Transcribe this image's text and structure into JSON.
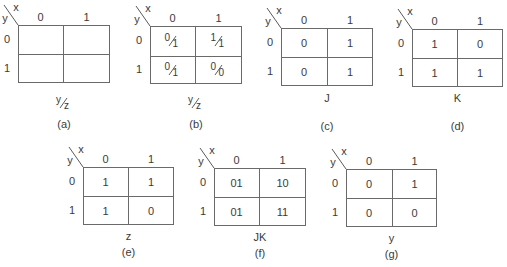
{
  "panels": [
    {
      "id": "a",
      "caption": "(a)",
      "row_var": "y",
      "col_var": "x",
      "col_headers": [
        "0",
        "1"
      ],
      "row_headers": [
        "0",
        "1"
      ],
      "cells": [
        [
          "",
          ""
        ],
        [
          "",
          ""
        ]
      ],
      "label": {
        "num": "y",
        "den": "z"
      }
    },
    {
      "id": "b",
      "caption": "(b)",
      "row_var": "y",
      "col_var": "x",
      "col_headers": [
        "0",
        "1"
      ],
      "row_headers": [
        "0",
        "1"
      ],
      "cells": [
        [
          {
            "num": "0",
            "den": "1"
          },
          {
            "num": "1",
            "den": "1"
          }
        ],
        [
          {
            "num": "0",
            "den": "1"
          },
          {
            "num": "0",
            "den": "0"
          }
        ]
      ],
      "label": {
        "num": "y",
        "den": "z"
      }
    },
    {
      "id": "c",
      "caption": "(c)",
      "row_var": "y",
      "col_var": "x",
      "col_headers": [
        "0",
        "1"
      ],
      "row_headers": [
        "0",
        "1"
      ],
      "cells": [
        [
          "0",
          "1"
        ],
        [
          "0",
          "1"
        ]
      ],
      "label": "J"
    },
    {
      "id": "d",
      "caption": "(d)",
      "row_var": "y",
      "col_var": "x",
      "col_headers": [
        "0",
        "1"
      ],
      "row_headers": [
        "0",
        "1"
      ],
      "cells": [
        [
          "1",
          "0"
        ],
        [
          "1",
          "1"
        ]
      ],
      "label": "K"
    },
    {
      "id": "e",
      "caption": "(e)",
      "row_var": "y",
      "col_var": "x",
      "col_headers": [
        "0",
        "1"
      ],
      "row_headers": [
        "0",
        "1"
      ],
      "cells": [
        [
          "1",
          "1"
        ],
        [
          "1",
          "0"
        ]
      ],
      "label": "z"
    },
    {
      "id": "f",
      "caption": "(f)",
      "row_var": "y",
      "col_var": "x",
      "col_headers": [
        "0",
        "1"
      ],
      "row_headers": [
        "0",
        "1"
      ],
      "cells": [
        [
          "01",
          "10"
        ],
        [
          "01",
          "11"
        ]
      ],
      "label": "JK"
    },
    {
      "id": "g",
      "caption": "(g)",
      "row_var": "y",
      "col_var": "x",
      "col_headers": [
        "0",
        "1"
      ],
      "row_headers": [
        "0",
        "1"
      ],
      "cells": [
        [
          "0",
          "1"
        ],
        [
          "0",
          "0"
        ]
      ],
      "label": "y"
    }
  ]
}
